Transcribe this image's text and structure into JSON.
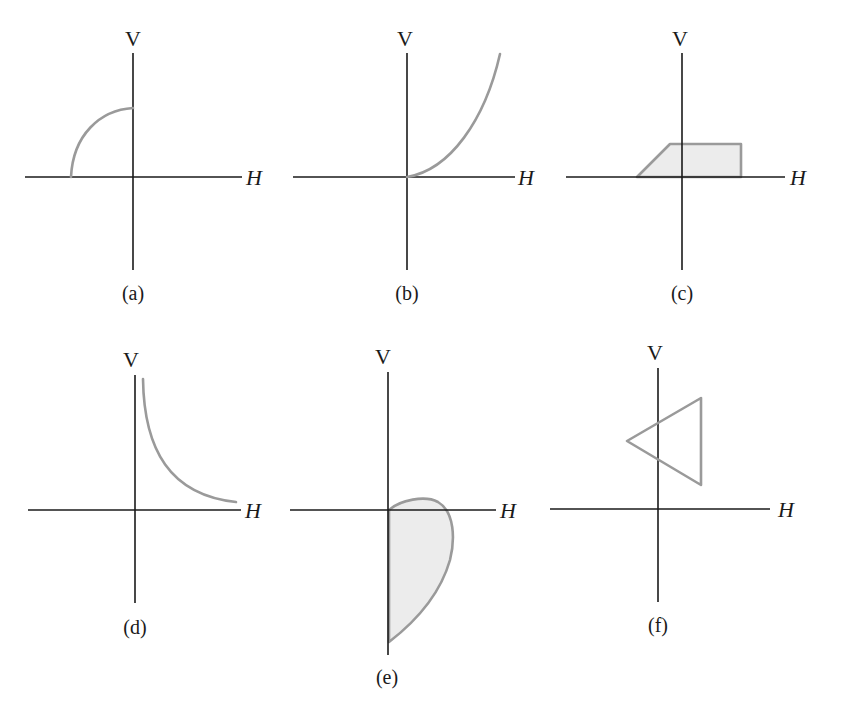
{
  "figure": {
    "axis_labels": {
      "vertical": "V",
      "horizontal": "H"
    },
    "panels": [
      {
        "id": "a",
        "caption": "(a)",
        "shape": "quarter-arc in upper-left quadrant from negative H-axis to positive V-axis",
        "colors": {
          "stroke": "#9a9a9a"
        }
      },
      {
        "id": "b",
        "caption": "(b)",
        "shape": "upward-curving line from origin into upper-right quadrant",
        "colors": {
          "stroke": "#9a9a9a"
        }
      },
      {
        "id": "c",
        "caption": "(c)",
        "shape": "filled trapezoid straddling V-axis above H-axis",
        "colors": {
          "stroke": "#9a9a9a",
          "fill": "#ececec"
        }
      },
      {
        "id": "d",
        "caption": "(d)",
        "shape": "decreasing hyperbola-like curve in upper-right quadrant",
        "colors": {
          "stroke": "#9a9a9a"
        }
      },
      {
        "id": "e",
        "caption": "(e)",
        "shape": "filled teardrop lobe mostly in lower-right quadrant",
        "colors": {
          "stroke": "#9a9a9a",
          "fill": "#ececec"
        }
      },
      {
        "id": "f",
        "caption": "(f)",
        "shape": "outlined triangle crossing V-axis in upper half",
        "colors": {
          "stroke": "#9a9a9a"
        }
      }
    ]
  }
}
